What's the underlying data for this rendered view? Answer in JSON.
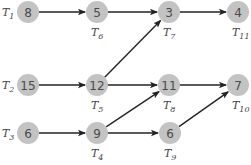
{
  "diagram": {
    "type": "task-dependency-graph",
    "colors": {
      "node_fill": "#c3c3c3",
      "node_text": "#4a4a4a",
      "edge": "#222222",
      "label": "#444444"
    },
    "nodes": [
      {
        "id": "T1",
        "value": "8",
        "label": "T",
        "sub": "1",
        "x": 28,
        "y": 12,
        "label_pos": "left"
      },
      {
        "id": "T6",
        "value": "5",
        "label": "T",
        "sub": "6",
        "x": 97,
        "y": 12,
        "label_pos": "below"
      },
      {
        "id": "T7",
        "value": "3",
        "label": "T",
        "sub": "7",
        "x": 169,
        "y": 12,
        "label_pos": "below"
      },
      {
        "id": "T11",
        "value": "4",
        "label": "T",
        "sub": "11",
        "x": 238,
        "y": 12,
        "label_pos": "below"
      },
      {
        "id": "T2",
        "value": "15",
        "label": "T",
        "sub": "2",
        "x": 28,
        "y": 85,
        "label_pos": "left"
      },
      {
        "id": "T5",
        "value": "12",
        "label": "T",
        "sub": "5",
        "x": 97,
        "y": 85,
        "label_pos": "below"
      },
      {
        "id": "T8",
        "value": "11",
        "label": "T",
        "sub": "8",
        "x": 169,
        "y": 85,
        "label_pos": "below"
      },
      {
        "id": "T10",
        "value": "7",
        "label": "T",
        "sub": "10",
        "x": 238,
        "y": 85,
        "label_pos": "below"
      },
      {
        "id": "T3",
        "value": "6",
        "label": "T",
        "sub": "3",
        "x": 28,
        "y": 133,
        "label_pos": "left"
      },
      {
        "id": "T4",
        "value": "9",
        "label": "T",
        "sub": "4",
        "x": 97,
        "y": 133,
        "label_pos": "below"
      },
      {
        "id": "T9",
        "value": "6",
        "label": "T",
        "sub": "9",
        "x": 170,
        "y": 133,
        "label_pos": "below"
      }
    ],
    "edges": [
      {
        "from": "T1",
        "to": "T6"
      },
      {
        "from": "T6",
        "to": "T7"
      },
      {
        "from": "T7",
        "to": "T11"
      },
      {
        "from": "T2",
        "to": "T5"
      },
      {
        "from": "T5",
        "to": "T7"
      },
      {
        "from": "T5",
        "to": "T8"
      },
      {
        "from": "T8",
        "to": "T10"
      },
      {
        "from": "T3",
        "to": "T4"
      },
      {
        "from": "T4",
        "to": "T8"
      },
      {
        "from": "T4",
        "to": "T9"
      },
      {
        "from": "T9",
        "to": "T10"
      }
    ]
  }
}
